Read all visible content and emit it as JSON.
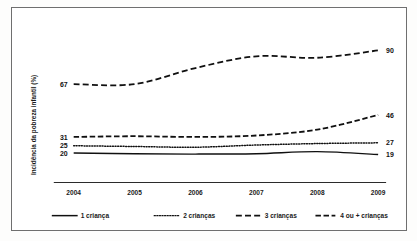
{
  "chart_data": {
    "type": "line",
    "title": "",
    "xlabel": "",
    "ylabel": "Incidência da pobreza infantil (%)",
    "categories": [
      "2004",
      "2005",
      "2006",
      "2007",
      "2008",
      "2009"
    ],
    "ylim": [
      0,
      100
    ],
    "grid": false,
    "legend_position": "bottom",
    "series": [
      {
        "name": "1 criança",
        "style": "solid",
        "values": [
          20,
          19.5,
          19.3,
          19.6,
          21,
          19
        ],
        "start_label": "20",
        "end_label": "19"
      },
      {
        "name": "2 crianças",
        "style": "dotted",
        "values": [
          25,
          24.5,
          24,
          25.5,
          26.5,
          27
        ],
        "start_label": "25",
        "end_label": "27"
      },
      {
        "name": "3 crianças",
        "style": "dashed",
        "values": [
          67,
          67,
          78,
          86,
          85,
          90
        ],
        "start_label": "67",
        "end_label": "90"
      },
      {
        "name": "4 ou + crianças",
        "style": "dashdot",
        "values": [
          31,
          31.5,
          31,
          32,
          36,
          46
        ],
        "start_label": "31",
        "end_label": "46"
      }
    ]
  },
  "legend": {
    "items": [
      {
        "label": "1 criança",
        "style": "solid"
      },
      {
        "label": "2 crianças",
        "style": "dotted"
      },
      {
        "label": "3 crianças",
        "style": "dashed"
      },
      {
        "label": "4 ou + crianças",
        "style": "dashdot"
      }
    ]
  }
}
